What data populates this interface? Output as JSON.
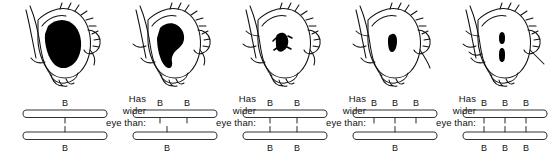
{
  "figure": {
    "name": "bar-eye-gene-dosage-series",
    "background_color": "#ffffff",
    "ink_color": "#111111",
    "gene_label": "B",
    "connector_text": {
      "line1": "Has",
      "line2": "wider",
      "line3": "eye than:"
    },
    "panels": [
      {
        "id": "panel-1",
        "eye": {
          "name": "fly-eye-wild-type",
          "pupil_shape": "large-oval",
          "pupil_width": 34,
          "pupil_height": 46
        },
        "chromosomes": {
          "top": {
            "gene_count": 1,
            "labels": [
              "B"
            ]
          },
          "bottom": {
            "gene_count": 1,
            "labels": [
              "B"
            ]
          }
        }
      },
      {
        "id": "panel-2",
        "eye": {
          "name": "fly-eye-bar",
          "pupil_shape": "kidney-oval",
          "pupil_width": 27,
          "pupil_height": 40
        },
        "chromosomes": {
          "top": {
            "gene_count": 2,
            "labels": [
              "B",
              "B"
            ]
          },
          "bottom": {
            "gene_count": 1,
            "labels": [
              "B"
            ]
          }
        }
      },
      {
        "id": "panel-3",
        "eye": {
          "name": "fly-eye-bar-homozygous",
          "pupil_shape": "small-irregular",
          "pupil_width": 16,
          "pupil_height": 22
        },
        "chromosomes": {
          "top": {
            "gene_count": 2,
            "labels": [
              "B",
              "B"
            ]
          },
          "bottom": {
            "gene_count": 2,
            "labels": [
              "B",
              "B"
            ]
          }
        }
      },
      {
        "id": "panel-4",
        "eye": {
          "name": "fly-eye-double-bar",
          "pupil_shape": "narrow-oval",
          "pupil_width": 9,
          "pupil_height": 20
        },
        "chromosomes": {
          "top": {
            "gene_count": 3,
            "labels": [
              "B",
              "B",
              "B"
            ]
          },
          "bottom": {
            "gene_count": 1,
            "labels": [
              "B"
            ]
          }
        }
      },
      {
        "id": "panel-5",
        "eye": {
          "name": "fly-eye-double-bar-homozygous",
          "pupil_shape": "slit-split",
          "pupil_width": 5,
          "pupil_height": 22
        },
        "chromosomes": {
          "top": {
            "gene_count": 3,
            "labels": [
              "B",
              "B",
              "B"
            ]
          },
          "bottom": {
            "gene_count": 3,
            "labels": [
              "B",
              "B",
              "B"
            ]
          }
        }
      }
    ],
    "connectors": [
      {
        "id": "connector-1-2"
      },
      {
        "id": "connector-2-3"
      },
      {
        "id": "connector-3-4"
      },
      {
        "id": "connector-4-5"
      }
    ]
  }
}
